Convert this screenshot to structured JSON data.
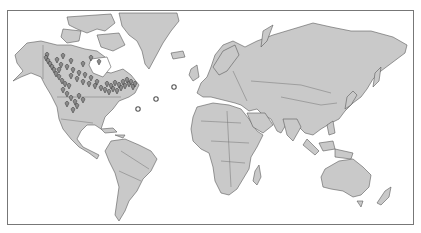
{
  "map": {
    "projection": "mercator",
    "style": "grayscale",
    "colors": {
      "ocean": "#ffffff",
      "land": "#c9c9c9",
      "coastline": "#5a5a5a",
      "frame": "#777777",
      "marker_fill": "#8a8a8a",
      "marker_stroke": "#333333"
    },
    "markers": {
      "pins": [
        [
          46,
          57
        ],
        [
          45,
          60
        ],
        [
          47,
          63
        ],
        [
          49,
          66
        ],
        [
          51,
          69
        ],
        [
          53,
          72
        ],
        [
          55,
          76
        ],
        [
          58,
          79
        ],
        [
          61,
          83
        ],
        [
          64,
          86
        ],
        [
          60,
          67
        ],
        [
          66,
          69
        ],
        [
          72,
          72
        ],
        [
          78,
          75
        ],
        [
          84,
          77
        ],
        [
          70,
          78
        ],
        [
          76,
          81
        ],
        [
          82,
          84
        ],
        [
          88,
          86
        ],
        [
          94,
          88
        ],
        [
          100,
          90
        ],
        [
          104,
          92
        ],
        [
          108,
          94
        ],
        [
          112,
          91
        ],
        [
          116,
          93
        ],
        [
          120,
          90
        ],
        [
          124,
          88
        ],
        [
          128,
          86
        ],
        [
          132,
          89
        ],
        [
          106,
          86
        ],
        [
          110,
          88
        ],
        [
          114,
          85
        ],
        [
          118,
          87
        ],
        [
          122,
          84
        ],
        [
          126,
          82
        ],
        [
          130,
          84
        ],
        [
          134,
          86
        ],
        [
          62,
          92
        ],
        [
          66,
          96
        ],
        [
          70,
          100
        ],
        [
          74,
          104
        ],
        [
          78,
          98
        ],
        [
          82,
          102
        ],
        [
          76,
          108
        ],
        [
          72,
          112
        ],
        [
          66,
          106
        ],
        [
          56,
          62
        ],
        [
          62,
          58
        ],
        [
          70,
          63
        ],
        [
          82,
          66
        ],
        [
          90,
          60
        ],
        [
          98,
          64
        ],
        [
          58,
          72
        ],
        [
          68,
          88
        ],
        [
          90,
          80
        ],
        [
          96,
          84
        ]
      ],
      "rings": [
        [
          173,
          86
        ],
        [
          155,
          98
        ],
        [
          137,
          108
        ]
      ]
    }
  }
}
